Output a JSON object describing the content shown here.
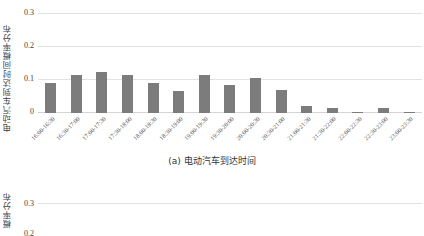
{
  "figure": {
    "caption_a": "(a) 电动汽车到达时间"
  },
  "chart_data": [
    {
      "type": "bar",
      "id": "chart-a",
      "title": "(a) 电动汽车到达时间",
      "ylabel": "电动汽车到达时间概率分布",
      "xlabel": "",
      "ylim": [
        0,
        0.3
      ],
      "yticks": [
        "0",
        "0.1",
        "0.2",
        "0.3"
      ],
      "ytick_values": [
        0,
        0.1,
        0.2,
        0.3
      ],
      "grid": true,
      "legend": "none",
      "bar_color": "#7c7c7c",
      "categories": [
        "16:00-16:30",
        "16:30-17:00",
        "17:00-17:30",
        "17:30-18:00",
        "18:00-18:30",
        "18:30-19:00",
        "19:00-19:30",
        "19:30-20:00",
        "20:00-20:30",
        "20:30-21:00",
        "21:00-21:30",
        "21:30-22:00",
        "22:00-22:30",
        "22:30-23:00",
        "23:00-23:30"
      ],
      "values": [
        0.091,
        0.115,
        0.124,
        0.115,
        0.091,
        0.068,
        0.115,
        0.085,
        0.107,
        0.069,
        0.022,
        0.014,
        0.003,
        0.016,
        0.004
      ]
    },
    {
      "type": "bar",
      "id": "chart-b",
      "title": "",
      "ylabel": "概率分布",
      "ylim": [
        0,
        0.3
      ],
      "yticks": [
        "0.3",
        "0.2"
      ],
      "grid": true,
      "note": "partially visible below chart (a)"
    }
  ]
}
